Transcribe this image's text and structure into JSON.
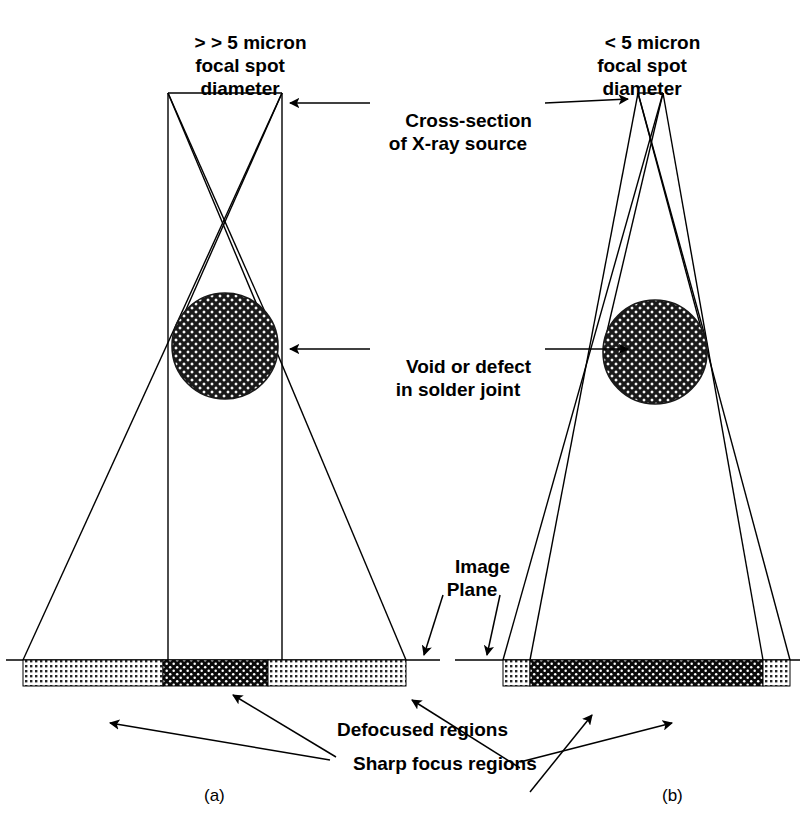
{
  "figure": {
    "title_text_blocks": {
      "source_left": "> > 5 micron\nfocal spot\ndiameter",
      "source_right": "< 5 micron\nfocal spot\ndiameter",
      "cross_section": "Cross-section\nof X-ray source",
      "void": "Void or defect\nin solder joint",
      "image_plane": "Image\nPlane",
      "defocused": "Defocused regions",
      "sharp_focus": "Sharp focus regions"
    },
    "captions": {
      "left": "(a)",
      "right": "(b)"
    },
    "colors": {
      "line": "#000000",
      "background": "#ffffff",
      "dark_band": "#101010",
      "light_band": "#d8d8d8",
      "void_fill": "#555555"
    }
  },
  "diagram_a": {
    "name": "large-focal-spot-diagram",
    "source": {
      "x1": 168,
      "x2": 282,
      "y": 93,
      "label": ">> 5 micron focal spot diameter"
    },
    "void": {
      "cx": 225,
      "cy": 346,
      "r": 53,
      "label": "Void or defect in solder joint"
    },
    "image_plane_y": 660,
    "bands": [
      {
        "type": "defocused",
        "x1": 23,
        "x2": 163,
        "shade": "light"
      },
      {
        "type": "sharp",
        "x1": 163,
        "x2": 268,
        "shade": "dark"
      },
      {
        "type": "defocused",
        "x1": 268,
        "x2": 406,
        "shade": "light"
      }
    ],
    "plane_line": {
      "x1": 6,
      "x2": 440
    }
  },
  "diagram_b": {
    "name": "small-focal-spot-diagram",
    "source": {
      "x1": 638,
      "x2": 663,
      "y": 93,
      "label": "< 5 micron focal spot diameter"
    },
    "void": {
      "cx": 655,
      "cy": 352,
      "r": 52,
      "label": "Void or defect in solder joint"
    },
    "image_plane_y": 660,
    "bands": [
      {
        "type": "defocused",
        "x1": 503,
        "x2": 530,
        "shade": "light"
      },
      {
        "type": "sharp",
        "x1": 530,
        "x2": 763,
        "shade": "dark"
      },
      {
        "type": "defocused",
        "x1": 763,
        "x2": 790,
        "shade": "light"
      }
    ],
    "plane_line": {
      "x1": 455,
      "x2": 800
    }
  }
}
